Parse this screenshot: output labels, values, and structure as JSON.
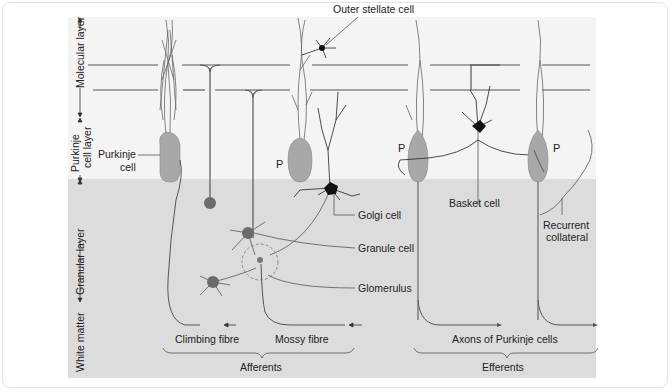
{
  "figure": {
    "colors": {
      "upper_bg": "#f4f4f4",
      "lower_bg": "#dcdcdc",
      "purkinje_soma": "#a8a8a8",
      "granule_soma": "#6b6b6b",
      "golgi_soma": "#111111",
      "line": "#555555"
    },
    "layers": {
      "molecular": "Molecular layer",
      "purkinje_1": "Purkinje",
      "purkinje_2": "cell layer",
      "granular": "Granular layer",
      "white_matter": "White matter"
    },
    "labels": {
      "outer_stellate": "Outer stellate cell",
      "purkinje_1": "Purkinje",
      "purkinje_2": "cell",
      "p1": "P",
      "p2": "P",
      "p3": "P",
      "golgi": "Golgi cell",
      "granule": "Granule cell",
      "glomerulus": "Glomerulus",
      "basket": "Basket cell",
      "recurrent_1": "Recurrent",
      "recurrent_2": "collateral",
      "climbing": "Climbing fibre",
      "mossy": "Mossy fibre",
      "afferents": "Afferents",
      "axons": "Axons of Purkinje cells",
      "efferents": "Efferents"
    }
  }
}
